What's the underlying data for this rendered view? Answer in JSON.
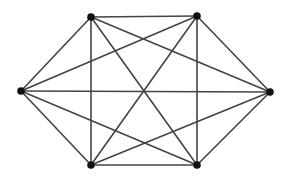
{
  "diagram": {
    "type": "complete-graph",
    "name": "K6",
    "canvas": {
      "width": 293,
      "height": 178,
      "background": "#ffffff"
    },
    "style": {
      "edge_color": "#444444",
      "edge_width": 1.6,
      "node_color": "#111111",
      "node_radius": 3.8
    },
    "nodes": [
      {
        "id": "top-left",
        "x": 91,
        "y": 17
      },
      {
        "id": "top-right",
        "x": 197,
        "y": 16
      },
      {
        "id": "right",
        "x": 270,
        "y": 92
      },
      {
        "id": "bottom-right",
        "x": 197,
        "y": 165
      },
      {
        "id": "bottom-left",
        "x": 91,
        "y": 165
      },
      {
        "id": "left",
        "x": 21,
        "y": 91
      }
    ],
    "edges": [
      [
        "top-left",
        "top-right"
      ],
      [
        "top-left",
        "right"
      ],
      [
        "top-left",
        "bottom-right"
      ],
      [
        "top-left",
        "bottom-left"
      ],
      [
        "top-left",
        "left"
      ],
      [
        "top-right",
        "right"
      ],
      [
        "top-right",
        "bottom-right"
      ],
      [
        "top-right",
        "bottom-left"
      ],
      [
        "top-right",
        "left"
      ],
      [
        "right",
        "bottom-right"
      ],
      [
        "right",
        "bottom-left"
      ],
      [
        "right",
        "left"
      ],
      [
        "bottom-right",
        "bottom-left"
      ],
      [
        "bottom-right",
        "left"
      ],
      [
        "bottom-left",
        "left"
      ]
    ]
  }
}
